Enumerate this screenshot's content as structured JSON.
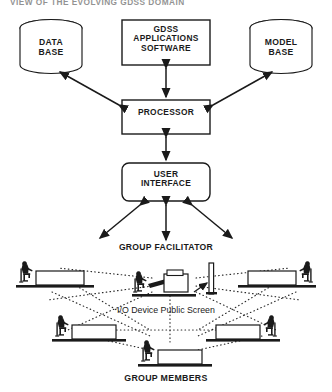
{
  "title": "VIEW OF THE EVOLVING GDSS DOMAIN",
  "diagram": {
    "type": "block-diagram",
    "nodes": {
      "data_base": {
        "label": "DATA\nBASE",
        "shape": "cylinder",
        "name": "data-base-node"
      },
      "model_base": {
        "label": "MODEL\nBASE",
        "shape": "cylinder",
        "name": "model-base-node"
      },
      "gdss_apps": {
        "label": "GDSS\nAPPLICATIONS\nSOFTWARE",
        "shape": "rectangle",
        "name": "gdss-applications-software-node"
      },
      "processor": {
        "label": "PROCESSOR",
        "shape": "rectangle",
        "name": "processor-node"
      },
      "user_interface": {
        "label": "USER\nINTERFACE",
        "shape": "rounded-rect",
        "name": "user-interface-node"
      }
    },
    "captions": {
      "group_facilitator": "GROUP FACILITATOR",
      "io_device_public_screen": "I/O Device Public Screen",
      "group_members": "GROUP MEMBERS"
    },
    "edges": [
      {
        "from": "gdss_apps",
        "to": "processor",
        "style": "solid",
        "arrows": "double"
      },
      {
        "from": "processor",
        "to": "data_base",
        "style": "solid",
        "arrows": "double"
      },
      {
        "from": "processor",
        "to": "model_base",
        "style": "solid",
        "arrows": "double"
      },
      {
        "from": "processor",
        "to": "user_interface",
        "style": "solid",
        "arrows": "double"
      },
      {
        "from": "user_interface",
        "to": "facilitator-left",
        "style": "solid",
        "arrows": "double"
      },
      {
        "from": "user_interface",
        "to": "facilitator-center",
        "style": "solid",
        "arrows": "double"
      },
      {
        "from": "user_interface",
        "to": "facilitator-right",
        "style": "solid",
        "arrows": "double"
      }
    ],
    "workstations": [
      {
        "name": "workstation-upper-left",
        "facing": "right"
      },
      {
        "name": "workstation-facilitator",
        "facing": "right"
      },
      {
        "name": "workstation-upper-right",
        "facing": "left"
      },
      {
        "name": "workstation-mid-left",
        "facing": "right"
      },
      {
        "name": "workstation-mid-right",
        "facing": "left"
      },
      {
        "name": "workstation-bottom",
        "facing": "right"
      }
    ],
    "public_screen": {
      "name": "public-screen-panel",
      "shape": "vertical-panel"
    },
    "network_style": "dotted"
  },
  "colors": {
    "ink": "#1a1a1a",
    "paper": "#ffffff",
    "title": "#3a3a3a",
    "dotted": "#2b2b2b"
  }
}
